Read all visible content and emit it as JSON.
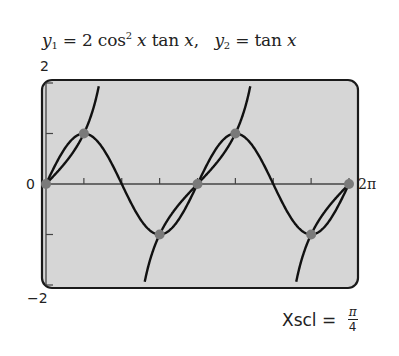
{
  "title": {
    "y1_label": "y",
    "y1_sub": "1",
    "y1_expr_a": " = 2 cos",
    "y1_sup": "2",
    "y1_expr_b": " x",
    "y1_expr_c": " tan ",
    "y1_expr_d": "x",
    "separator": ",   ",
    "y2_label": "y",
    "y2_sub": "2",
    "y2_expr_a": " = tan ",
    "y2_expr_b": "x"
  },
  "labels": {
    "ymax": "2",
    "ymin": "−2",
    "origin": "0",
    "xmax": "2π",
    "xscl_text": "Xscl = ",
    "xscl_num": "π",
    "xscl_den": "4"
  },
  "colors": {
    "screen_bg": "#d6d6d6",
    "frame": "#1a1a1a",
    "curve": "#111111",
    "axis": "#444444",
    "point": "#7a7a7a"
  },
  "chart_data": {
    "type": "line",
    "xlabel": "",
    "ylabel": "",
    "xlim": [
      0,
      6.2832
    ],
    "ylim": [
      -2,
      2
    ],
    "x_tick_spacing": "pi/4",
    "y_tick_spacing": 1,
    "x_tick_labels": [
      "0",
      "2π"
    ],
    "y_tick_labels": [
      "2",
      "−2"
    ],
    "grid": false,
    "series": [
      {
        "name": "y1 = 2cos^2(x)tan(x) = sin(2x)",
        "x": [
          0,
          0.3927,
          0.7854,
          1.1781,
          1.5708,
          1.9635,
          2.3562,
          2.7489,
          3.1416,
          3.5343,
          3.927,
          4.3197,
          4.7124,
          5.1051,
          5.4978,
          5.8905,
          6.2832
        ],
        "values": [
          0,
          0.707,
          1,
          0.707,
          0,
          -0.707,
          -1,
          -0.707,
          0,
          0.707,
          1,
          0.707,
          0,
          -0.707,
          -1,
          -0.707,
          0
        ]
      },
      {
        "name": "y2 = tan x",
        "x": [
          0,
          0.3927,
          0.7854,
          1.1071,
          2.0344,
          2.3562,
          2.7489,
          3.1416,
          3.5343,
          3.927,
          4.2487,
          5.176,
          5.4978,
          5.8905,
          6.2832
        ],
        "values": [
          0,
          0.414,
          1,
          2,
          -2,
          -1,
          -0.414,
          0,
          0.414,
          1,
          2,
          -2,
          -1,
          -0.414,
          0
        ]
      }
    ],
    "intersection_points": [
      {
        "x": 0,
        "y": 0
      },
      {
        "x": 0.7854,
        "y": 1
      },
      {
        "x": 2.3562,
        "y": -1
      },
      {
        "x": 3.1416,
        "y": 0
      },
      {
        "x": 3.927,
        "y": 1
      },
      {
        "x": 5.4978,
        "y": -1
      },
      {
        "x": 6.2832,
        "y": 0
      }
    ],
    "annotations": [
      "Xscl = π/4"
    ]
  }
}
